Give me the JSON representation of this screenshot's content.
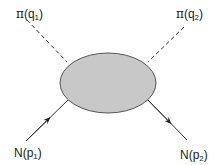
{
  "diagram": {
    "type": "feynman",
    "blob": {
      "cx": 108,
      "cy": 83,
      "rx": 48,
      "ry": 30,
      "fill": "#c8c8c8",
      "stroke": "#555555"
    },
    "lines": [
      {
        "id": "pion-in",
        "style": "dashed",
        "x1": 27,
        "y1": 20,
        "x2": 67,
        "y2": 62
      },
      {
        "id": "pion-out",
        "style": "dashed",
        "x1": 184,
        "y1": 27,
        "x2": 148,
        "y2": 62
      },
      {
        "id": "nucleon-in",
        "style": "solid-arrow",
        "x1": 26,
        "y1": 141,
        "x2": 68,
        "y2": 100
      },
      {
        "id": "nucleon-out",
        "style": "solid-arrow",
        "x1": 145,
        "y1": 97,
        "x2": 187,
        "y2": 140
      }
    ],
    "labels": {
      "pion_in": {
        "particle": "π",
        "open": "(q",
        "sub": "1",
        "close": ")"
      },
      "pion_out": {
        "particle": "π",
        "open": "(q",
        "sub": "2",
        "close": ")"
      },
      "nucleon_in": {
        "particle": "N",
        "open": "(p",
        "sub": "1",
        "close": ")"
      },
      "nucleon_out": {
        "particle": "N",
        "open": "(p",
        "sub": "2",
        "close": ")"
      }
    },
    "colors": {
      "line": "#333333",
      "blob_fill": "#c8c8c8",
      "text": "#222222"
    }
  }
}
